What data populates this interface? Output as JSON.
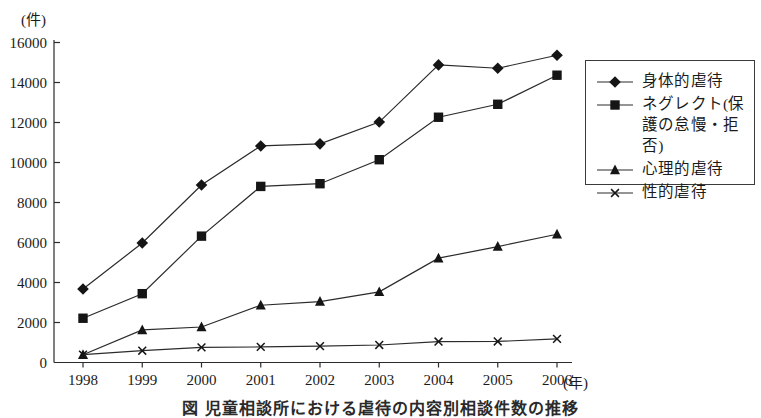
{
  "figure": {
    "caption": "図 児童相談所における虐待の内容別相談件数の推移",
    "background": "#ffffff"
  },
  "chart_data": {
    "type": "line",
    "title": "児童相談所における虐待の内容別相談件数の推移",
    "y_unit": "(件)",
    "x_unit": "(年)",
    "categories": [
      "1998",
      "1999",
      "2000",
      "2001",
      "2002",
      "2003",
      "2004",
      "2005",
      "2006"
    ],
    "series": [
      {
        "name": "身体的虐待",
        "marker": "diamond",
        "values": [
          3673,
          5973,
          8877,
          10828,
          10932,
          12022,
          14881,
          14712,
          15364
        ]
      },
      {
        "name": "ネグレクト(保護の怠慢・拒否)",
        "marker": "square",
        "values": [
          2213,
          3441,
          6318,
          8804,
          8940,
          10140,
          12263,
          12911,
          14365
        ]
      },
      {
        "name": "心理的虐待",
        "marker": "triangle",
        "values": [
          390,
          1627,
          1776,
          2864,
          3046,
          3531,
          5216,
          5797,
          6414
        ]
      },
      {
        "name": "性的虐待",
        "marker": "x",
        "values": [
          396,
          590,
          754,
          778,
          820,
          876,
          1048,
          1052,
          1180
        ]
      }
    ],
    "ylim": [
      0,
      16000
    ],
    "yticks": [
      0,
      2000,
      4000,
      6000,
      8000,
      10000,
      12000,
      14000,
      16000
    ],
    "grid": false,
    "legend_position": "right",
    "colors": {
      "line": "#2b2b2b",
      "marker": "#151515",
      "text": "#1b1b1b"
    }
  }
}
